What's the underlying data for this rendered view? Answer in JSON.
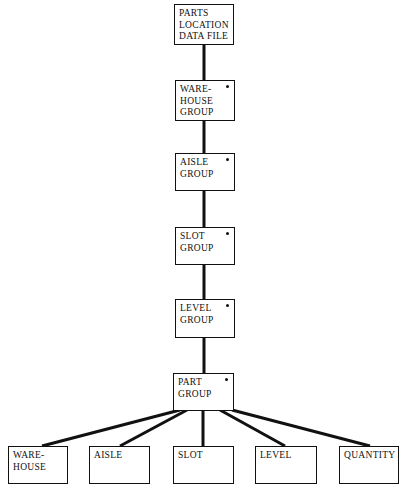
{
  "diagram": {
    "type": "hierarchy",
    "root": {
      "id": "root",
      "lines": [
        "PARTS",
        "LOCATION",
        "DATA FILE"
      ],
      "marker": false
    },
    "groups": [
      {
        "id": "warehouse-group",
        "lines": [
          "WARE-",
          "HOUSE",
          "GROUP"
        ],
        "marker": true
      },
      {
        "id": "aisle-group",
        "lines": [
          "AISLE",
          "GROUP"
        ],
        "marker": true
      },
      {
        "id": "slot-group",
        "lines": [
          "SLOT",
          "GROUP"
        ],
        "marker": true
      },
      {
        "id": "level-group",
        "lines": [
          "LEVEL",
          "GROUP"
        ],
        "marker": true
      },
      {
        "id": "part-group",
        "lines": [
          "PART",
          "GROUP"
        ],
        "marker": true
      }
    ],
    "leaves": [
      {
        "id": "leaf-warehouse",
        "lines": [
          "WARE-",
          "HOUSE"
        ]
      },
      {
        "id": "leaf-aisle",
        "lines": [
          "AISLE"
        ]
      },
      {
        "id": "leaf-slot",
        "lines": [
          "SLOT"
        ]
      },
      {
        "id": "leaf-level",
        "lines": [
          "LEVEL"
        ]
      },
      {
        "id": "leaf-quantity",
        "lines": [
          "QUANTITY"
        ]
      }
    ],
    "edges": [
      [
        "root",
        "warehouse-group"
      ],
      [
        "warehouse-group",
        "aisle-group"
      ],
      [
        "aisle-group",
        "slot-group"
      ],
      [
        "slot-group",
        "level-group"
      ],
      [
        "level-group",
        "part-group"
      ],
      [
        "part-group",
        "leaf-warehouse"
      ],
      [
        "part-group",
        "leaf-aisle"
      ],
      [
        "part-group",
        "leaf-slot"
      ],
      [
        "part-group",
        "leaf-level"
      ],
      [
        "part-group",
        "leaf-quantity"
      ]
    ],
    "colors": {
      "stroke": "#111111",
      "background": "#ffffff"
    }
  }
}
